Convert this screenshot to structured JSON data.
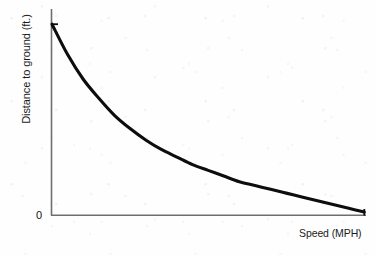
{
  "figure": {
    "background_color": "#fefefe",
    "bottom_rule_color": "#1a1a1a"
  },
  "axes": {
    "y_title": "Distance to ground (ft.)",
    "x_title": "Speed (MPH)",
    "origin_label": "0",
    "axis_line_color": "#6e6e6e"
  },
  "curve": {
    "color": "#0d0d0d",
    "width_px": 3.1
  },
  "chart_data": {
    "type": "line",
    "title": "",
    "subtitle": "",
    "xlabel": "Speed (MPH)",
    "ylabel": "Distance to ground (ft.)",
    "grid": false,
    "legend": false,
    "legend_position": "none",
    "x_tick_labels": [],
    "y_tick_labels": [
      "0"
    ],
    "xlim": [
      0,
      100
    ],
    "ylim": [
      0,
      100
    ],
    "annotations": [
      {
        "text": "0",
        "x": 0,
        "y": 0,
        "note": "origin label at lower-left of axes"
      }
    ],
    "series": [
      {
        "name": "Distance to ground vs speed",
        "description": "Monotonically decreasing exponential-decay curve from high distance at low speed to near zero at high speed",
        "x": [
          0,
          5,
          10,
          15,
          20,
          25,
          30,
          35,
          40,
          45,
          50,
          55,
          60,
          65,
          70,
          75,
          80,
          85,
          90,
          95,
          100
        ],
        "y": [
          100,
          84,
          71,
          61,
          52,
          45,
          39,
          34,
          30,
          26,
          23,
          20,
          17,
          15,
          13,
          11,
          9,
          7,
          5,
          3,
          1
        ]
      }
    ]
  }
}
